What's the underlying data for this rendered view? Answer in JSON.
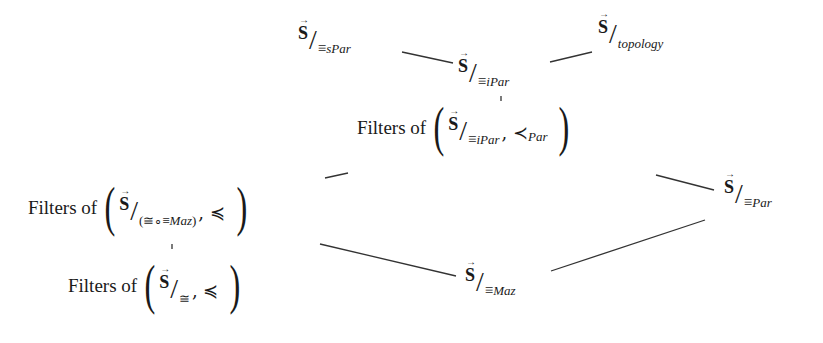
{
  "nodes": {
    "spar": {
      "base": "S",
      "sub_eq": "≡",
      "sub": "sPar"
    },
    "topology": {
      "base": "S",
      "sub": "topology"
    },
    "ipar": {
      "base": "S",
      "sub_eq": "≡",
      "sub": "iPar"
    },
    "filters_ipar": {
      "prefix": "Filters of",
      "base": "S",
      "sub_eq": "≡",
      "sub": "iPar",
      "relation": ", ≺",
      "relation_sub": "Par"
    },
    "filters_congmaz": {
      "prefix": "Filters of",
      "base": "S",
      "sub": "(≅∘≡",
      "sub_italic": "Maz",
      "sub_close": ")",
      "relation": ", ≼"
    },
    "par": {
      "base": "S",
      "sub_eq": "≡",
      "sub": "Par"
    },
    "filters_cong": {
      "prefix": "Filters of",
      "base": "S",
      "sub": "≅",
      "relation": ", ≼"
    },
    "maz": {
      "base": "S",
      "sub_eq": "≡",
      "sub": "Maz"
    }
  },
  "edges": [
    {
      "from": "spar",
      "to": "ipar",
      "x1": 402,
      "y1": 52,
      "x2": 453,
      "y2": 63
    },
    {
      "from": "ipar",
      "to": "topology",
      "x1": 550,
      "y1": 62,
      "x2": 592,
      "y2": 52
    },
    {
      "from": "ipar",
      "to": "filters_ipar",
      "x1": 501,
      "y1": 96,
      "x2": 501,
      "y2": 101
    },
    {
      "from": "filters_congmaz",
      "to": "filters_ipar",
      "x1": 325,
      "y1": 178,
      "x2": 348,
      "y2": 173
    },
    {
      "from": "filters_ipar",
      "to": "par",
      "x1": 656,
      "y1": 175,
      "x2": 714,
      "y2": 190
    },
    {
      "from": "filters_congmaz",
      "to": "filters_cong",
      "x1": 172,
      "y1": 244,
      "x2": 172,
      "y2": 249
    },
    {
      "from": "filters_congmaz",
      "to": "maz",
      "x1": 320,
      "y1": 244,
      "x2": 456,
      "y2": 276
    },
    {
      "from": "maz",
      "to": "par",
      "x1": 551,
      "y1": 271,
      "x2": 705,
      "y2": 220
    }
  ]
}
